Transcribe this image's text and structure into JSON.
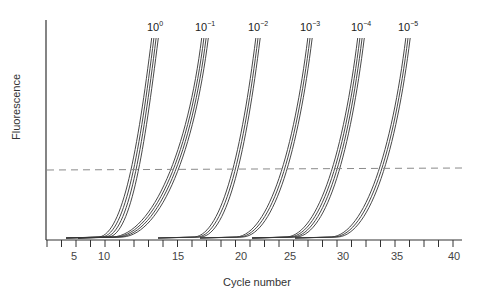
{
  "chart_data": {
    "type": "line",
    "title": "",
    "xlabel": "Cycle number",
    "ylabel": "Fluorescence",
    "xlim": [
      2,
      41
    ],
    "x_tick_labels": [
      "5",
      "10",
      "15",
      "20",
      "25",
      "30",
      "35",
      "40"
    ],
    "y_tick_labels": [],
    "grid": false,
    "legend": "inline labels above curve groups",
    "threshold": {
      "style": "dashed",
      "color": "#888888",
      "relative_height": 0.33
    },
    "series": [
      {
        "name": "10^0",
        "label_base": "10",
        "label_exp": "0",
        "replicates": 4,
        "ct": 12
      },
      {
        "name": "10^-1",
        "label_base": "10",
        "label_exp": "−1",
        "replicates": 4,
        "ct": 16
      },
      {
        "name": "10^-2",
        "label_base": "10",
        "label_exp": "−2",
        "replicates": 3,
        "ct": 20
      },
      {
        "name": "10^-3",
        "label_base": "10",
        "label_exp": "−3",
        "replicates": 3,
        "ct": 25
      },
      {
        "name": "10^-4",
        "label_base": "10",
        "label_exp": "−4",
        "replicates": 4,
        "ct": 30
      },
      {
        "name": "10^-5",
        "label_base": "10",
        "label_exp": "−5",
        "replicates": 3,
        "ct": 34
      }
    ],
    "line_color": "#333333"
  },
  "labels": {
    "xlabel": "Cycle number",
    "ylabel": "Fluorescence"
  }
}
